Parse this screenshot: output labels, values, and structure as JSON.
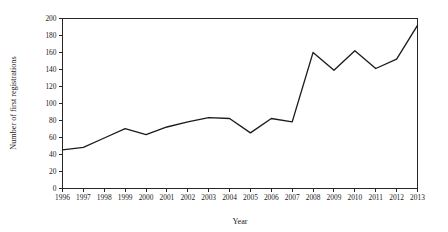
{
  "chart_data": {
    "type": "line",
    "title": "",
    "xlabel": "Year",
    "ylabel": "Number of first registrations",
    "x": [
      1996,
      1997,
      1998,
      1999,
      2000,
      2001,
      2002,
      2003,
      2004,
      2005,
      2006,
      2007,
      2008,
      2009,
      2010,
      2011,
      2012,
      2013
    ],
    "categories": [
      "1996",
      "1997",
      "1998",
      "1999",
      "2000",
      "2001",
      "2002",
      "2003",
      "2004",
      "2005",
      "2006",
      "2007",
      "2008",
      "2009",
      "2010",
      "2011",
      "2012",
      "2013"
    ],
    "series": [
      {
        "name": "First registrations",
        "values": [
          45,
          48,
          59,
          70,
          63,
          72,
          78,
          83,
          82,
          65,
          82,
          78,
          160,
          139,
          162,
          141,
          152,
          192
        ]
      }
    ],
    "values": [
      45,
      48,
      59,
      70,
      63,
      72,
      78,
      83,
      82,
      65,
      82,
      78,
      160,
      139,
      162,
      141,
      152,
      192
    ],
    "xlim": [
      1996,
      2013
    ],
    "ylim": [
      0,
      200
    ],
    "y_ticks": [
      0,
      20,
      40,
      60,
      80,
      100,
      120,
      140,
      160,
      180,
      200
    ],
    "y_tick_labels": [
      "0",
      "20",
      "40",
      "60",
      "80",
      "100",
      "120",
      "140",
      "160",
      "180",
      "200"
    ],
    "grid": false,
    "legend": false,
    "legend_position": "none",
    "line_color": "#1c1c1c",
    "axis_color": "#262626",
    "background_color": "#ffffff"
  }
}
